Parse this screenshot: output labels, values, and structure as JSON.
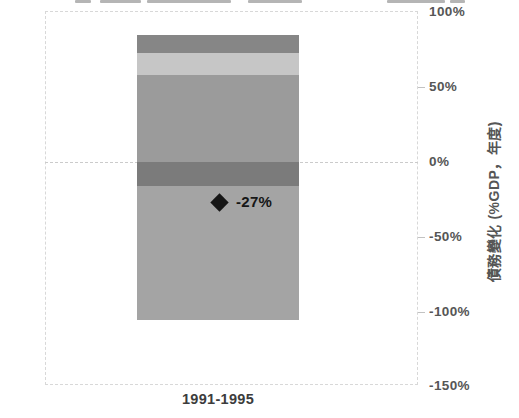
{
  "chart_data": {
    "type": "bar",
    "subtype": "stacked-bar-with-net-marker",
    "title": "",
    "categories": [
      "1991-1995"
    ],
    "xlabel": "",
    "ylabel": "債務變化 (%GDP，年度)",
    "ylim": [
      -150,
      100
    ],
    "grid": "dashed frame; full dashed gridline at 0%; short ticks at 50%, -50%, -100%; legend cropped off at top edge",
    "legend_position": "cropped-above-top-edge",
    "yticks": [
      {
        "label": "100%",
        "value": 100
      },
      {
        "label": "50%",
        "value": 50
      },
      {
        "label": "0%",
        "value": 0
      },
      {
        "label": "-50%",
        "value": -50
      },
      {
        "label": "-100%",
        "value": -100
      },
      {
        "label": "-150%",
        "value": -150
      }
    ],
    "series": [
      {
        "name": "segment-medium-gray-positive",
        "color": "#9b9b9b",
        "values": [
          58
        ]
      },
      {
        "name": "segment-light-gray-positive",
        "color": "#c6c6c6",
        "values": [
          15
        ]
      },
      {
        "name": "segment-dark-gray-positive",
        "color": "#868686",
        "values": [
          12
        ]
      },
      {
        "name": "segment-dark-gray-negative",
        "color": "#7b7b7b",
        "values": [
          -16
        ]
      },
      {
        "name": "segment-medium-gray-negative",
        "color": "#a4a4a4",
        "values": [
          -90
        ]
      }
    ],
    "net_marker": {
      "shape": "diamond",
      "color": "#161616",
      "value": -27,
      "label": "-27%"
    }
  },
  "colors": {
    "frame": "#d8d8d8",
    "zero_line": "#cbcbcb",
    "tick_mark": "#c2c2c2",
    "tick_text": "#565656",
    "axis_title_text": "#565656",
    "x_label_text": "#3c3c3c",
    "marker_text": "#161616",
    "legend_fragment": "#b5b5b5"
  },
  "layout_fragments": {
    "note": "bottom slivers of cropped legend text visible at top edge"
  }
}
